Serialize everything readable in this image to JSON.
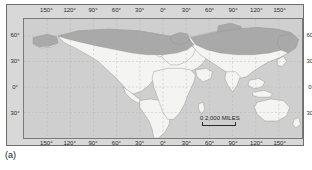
{
  "figure": {
    "caption": "(a)",
    "panel_bg": "#d8d8d8",
    "frame_color": "#6e6e6e"
  },
  "map": {
    "title": "World map with northern high-latitude shaded zone",
    "ocean_color": "#cfcfcf",
    "land_color": "#f4f4f2",
    "shaded_zone_color": "#a9a9a9",
    "coastline_color": "#8a8a8a",
    "graticule_color": "#b0b0b0",
    "projection": "cylindrical",
    "lon_range": [
      -180,
      180
    ],
    "lat_range": [
      -60,
      80
    ]
  },
  "graticule": {
    "longitude_labels_top": [
      {
        "text": "150°",
        "value": -150
      },
      {
        "text": "120°",
        "value": -120
      },
      {
        "text": "90°",
        "value": -90
      },
      {
        "text": "60°",
        "value": -60
      },
      {
        "text": "30°",
        "value": -30
      },
      {
        "text": "0°",
        "value": 0
      },
      {
        "text": "30°",
        "value": 30
      },
      {
        "text": "60°",
        "value": 60
      },
      {
        "text": "90°",
        "value": 90
      },
      {
        "text": "120°",
        "value": 120
      },
      {
        "text": "150°",
        "value": 150
      }
    ],
    "longitude_labels_bottom": [
      {
        "text": "150°",
        "value": -150
      },
      {
        "text": "120°",
        "value": -120
      },
      {
        "text": "90°",
        "value": -90
      },
      {
        "text": "60°",
        "value": -60
      },
      {
        "text": "30°",
        "value": -30
      },
      {
        "text": "0°",
        "value": 0
      },
      {
        "text": "30°",
        "value": 30
      },
      {
        "text": "60°",
        "value": 60
      },
      {
        "text": "90°",
        "value": 90
      },
      {
        "text": "120°",
        "value": 120
      },
      {
        "text": "150°",
        "value": 150
      }
    ],
    "latitude_labels_left": [
      {
        "text": "60°",
        "value": 60
      },
      {
        "text": "30°",
        "value": 30
      },
      {
        "text": "0°",
        "value": 0
      },
      {
        "text": "30°",
        "value": -30
      }
    ],
    "latitude_labels_right": [
      {
        "text": "60°",
        "value": 60
      },
      {
        "text": "30°",
        "value": 30
      },
      {
        "text": "0°",
        "value": 0
      },
      {
        "text": "30°",
        "value": -30
      }
    ]
  },
  "scale": {
    "miles_label": "0          2,000 MILES",
    "miles_zero": "0",
    "miles_text": "2,000 MILES",
    "km_label": "0 2,000 KILOMETERS",
    "km_zero": "0",
    "km_text": "2,000 KILOMETERS"
  }
}
